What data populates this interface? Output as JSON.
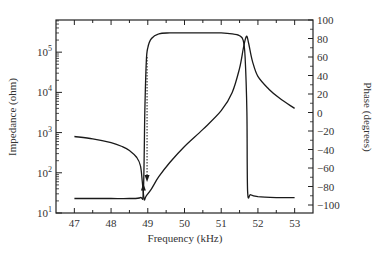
{
  "chart_data": {
    "type": "line",
    "title": "",
    "xlabel": "Frequency (kHz)",
    "ylabel": "Impedance (ohm)",
    "y2label": "Phase (degrees)",
    "xlim": [
      46.5,
      53.5
    ],
    "ylim_log10": [
      1,
      5.8
    ],
    "y2lim": [
      -100,
      100
    ],
    "grid": false,
    "legend": "none",
    "x_ticks": [
      "47",
      "48",
      "49",
      "50",
      "51",
      "52",
      "53"
    ],
    "x_tick_values": [
      47,
      48,
      49,
      50,
      51,
      52,
      53
    ],
    "y_ticks": [
      "10^1",
      "10^2",
      "10^3",
      "10^4",
      "10^5"
    ],
    "y_tick_exponents": [
      1,
      2,
      3,
      4,
      5
    ],
    "y2_ticks": [
      "100",
      "80",
      "60",
      "40",
      "20",
      "0",
      "-20",
      "-40",
      "-60",
      "-80",
      "-100"
    ],
    "y2_tick_values": [
      100,
      80,
      60,
      40,
      20,
      0,
      -20,
      -40,
      -60,
      -80,
      -100
    ],
    "series": [
      {
        "name": "Impedance",
        "axis": "left",
        "scale": "log",
        "x": [
          47.0,
          47.5,
          48.0,
          48.3,
          48.5,
          48.7,
          48.8,
          48.85,
          48.9,
          48.95,
          49.1,
          49.3,
          49.6,
          50.0,
          50.5,
          51.0,
          51.3,
          51.5,
          51.6,
          51.65,
          51.7,
          51.75,
          51.85,
          52.0,
          52.3,
          52.6,
          53.0
        ],
        "values": [
          800,
          700,
          560,
          450,
          360,
          240,
          150,
          60,
          22,
          26,
          40,
          80,
          180,
          450,
          1200,
          3500,
          10000,
          40000,
          120000,
          200000,
          250000,
          160000,
          60000,
          25000,
          12000,
          7000,
          4000
        ]
      },
      {
        "name": "Phase",
        "axis": "right",
        "scale": "linear",
        "x": [
          47.0,
          47.5,
          48.0,
          48.5,
          48.8,
          48.88,
          48.92,
          48.96,
          49.0,
          49.1,
          49.3,
          49.6,
          50.0,
          50.5,
          51.0,
          51.3,
          51.5,
          51.6,
          51.65,
          51.7,
          51.72,
          51.8,
          52.0,
          52.5,
          53.0
        ],
        "values": [
          -93,
          -93,
          -93,
          -93,
          -92,
          -85,
          0,
          55,
          70,
          80,
          85,
          86,
          86,
          86,
          86,
          85,
          83,
          78,
          60,
          0,
          -85,
          -89,
          -91,
          -92,
          -92
        ]
      }
    ],
    "annotations": [
      {
        "type": "arrow-up",
        "label": "up-sweep",
        "x": 48.88,
        "y_phase": -80
      },
      {
        "type": "arrow-down",
        "label": "down-sweep (dotted)",
        "x": 48.98,
        "y_phase_from": 60,
        "y_phase_to": -72
      }
    ]
  }
}
